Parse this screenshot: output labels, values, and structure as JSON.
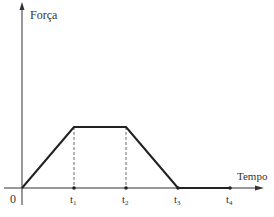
{
  "diagram": {
    "y_axis_label": "Força",
    "x_axis_label": "Tempo",
    "origin_label": "0",
    "ticks": [
      {
        "label": "t",
        "sub": "1"
      },
      {
        "label": "t",
        "sub": "2"
      },
      {
        "label": "t",
        "sub": "3"
      },
      {
        "label": "t",
        "sub": "4"
      }
    ],
    "colors": {
      "line": "#222222",
      "axis": "#333333"
    }
  }
}
